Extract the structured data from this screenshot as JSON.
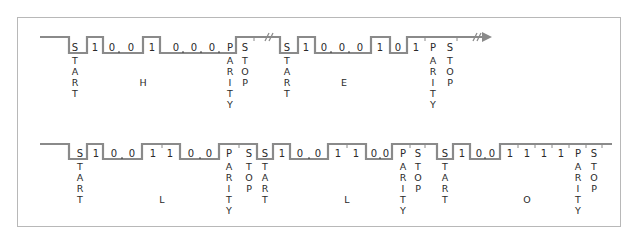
{
  "diagram": {
    "colors": {
      "signal": "#8a8a8a",
      "text": "#2a2a2a",
      "frame": "#b8b8b8"
    },
    "rows": [
      {
        "id": "row1",
        "characters": [
          {
            "char": "H",
            "bits": [
              "1",
              "0",
              "0",
              "1",
              "0",
              "0",
              "0"
            ],
            "start": "START",
            "parity": "PARITY",
            "stop": "STOP"
          },
          {
            "char": "E",
            "bits": [
              "1",
              "0",
              "0",
              "0",
              "1",
              "0",
              "1"
            ],
            "start": "START",
            "parity": "PARITY",
            "stop": "STOP"
          }
        ],
        "continues_arrow": true
      },
      {
        "id": "row2",
        "characters": [
          {
            "char": "L",
            "bits": [
              "1",
              "0",
              "0",
              "1",
              "1",
              "0",
              "0"
            ],
            "start": "START",
            "parity": "PARITY",
            "stop": "STOP"
          },
          {
            "char": "L",
            "bits": [
              "1",
              "0",
              "0",
              "1",
              "1",
              "0",
              "0"
            ],
            "start": "START",
            "parity": "PARITY",
            "stop": "STOP"
          },
          {
            "char": "O",
            "bits": [
              "1",
              "0",
              "0",
              "1",
              "1",
              "1",
              "1"
            ],
            "start": "START",
            "parity": "PARITY",
            "stop": "STOP"
          }
        ]
      }
    ],
    "labels": {
      "start": [
        "S",
        "T",
        "A",
        "R",
        "T"
      ],
      "parity": [
        "P",
        "A",
        "R",
        "I",
        "T",
        "Y"
      ],
      "stop": [
        "S",
        "T",
        "O",
        "P"
      ],
      "one": "1",
      "zero": "0",
      "break": "//"
    }
  }
}
